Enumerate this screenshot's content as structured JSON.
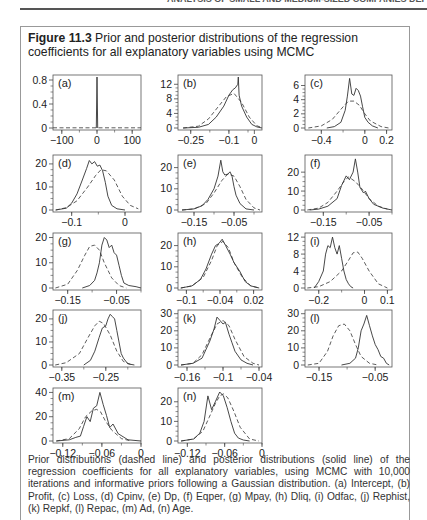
{
  "page": {
    "running_head": "ANALYSIS OF SMALL AND MEDIUM-SIZED COMPANIES DEF"
  },
  "figure": {
    "label": "Figure 11.3",
    "title": "Prior and posterior distributions of the regression coefficients for all explanatory variables using MCMC",
    "caption": "Prior distributions (dashed line) and posterior distributions (solid line) of the regression coefficients for all explanatory variables, using MCMC with 10,000 iterations and informative priors following a Gaussian distribution. (a) Intercept, (b) Profit, (c) Loss, (d) Cpinv, (e) Dp, (f) Eqper, (g) Mpay, (h) Dliq, (i) Odfac, (j) Rephist, (k) Repkf, (l) Repac, (m) Ad, (n) Age."
  },
  "colors": {
    "line": "#333333",
    "axis": "#444444",
    "frame": "#555555"
  },
  "chart_data": [
    {
      "panel": "(a)",
      "variable": "Intercept",
      "type": "line",
      "xlim": [
        -125,
        125
      ],
      "ylim": [
        0,
        0.85
      ],
      "xticks": [
        -100,
        0,
        100
      ],
      "yticks": [
        0,
        0.4,
        0.8
      ],
      "ytick_labels": [
        "0",
        "0.4",
        "0.8"
      ],
      "prior": {
        "x": [
          -125,
          125
        ],
        "y": [
          0.004,
          0.004
        ]
      },
      "posterior": {
        "x": [
          -2,
          0,
          0.001,
          2
        ],
        "y": [
          0,
          0.85,
          0.85,
          0
        ]
      }
    },
    {
      "panel": "(b)",
      "variable": "Profit",
      "type": "line",
      "xlim": [
        -0.3,
        0.03
      ],
      "ylim": [
        0,
        14
      ],
      "xticks": [
        -0.25,
        -0.1,
        0
      ],
      "ytick_labels": [
        "0",
        "4",
        "8",
        "12"
      ],
      "yticks": [
        0,
        4,
        8,
        12
      ],
      "prior": {
        "x": [
          -0.28,
          -0.22,
          -0.18,
          -0.14,
          -0.11,
          -0.08,
          -0.05,
          -0.02,
          0.01,
          0.03
        ],
        "y": [
          0,
          0.5,
          2.5,
          6,
          8.6,
          9.5,
          7,
          3,
          0.6,
          0.1
        ]
      },
      "posterior": {
        "x": [
          -0.28,
          -0.22,
          -0.18,
          -0.15,
          -0.12,
          -0.1,
          -0.085,
          -0.075,
          -0.065,
          -0.063,
          -0.06,
          -0.05,
          -0.03,
          -0.01,
          0.01,
          0.03
        ],
        "y": [
          0,
          0.2,
          1,
          3,
          6,
          9,
          10.5,
          11,
          12,
          14,
          9,
          6,
          3,
          1,
          0.3,
          0
        ]
      }
    },
    {
      "panel": "(c)",
      "variable": "Loss",
      "type": "line",
      "xlim": [
        -0.55,
        0.25
      ],
      "ylim": [
        0,
        7.2
      ],
      "xticks": [
        -0.4,
        0,
        0.2
      ],
      "yticks": [
        0,
        2,
        4,
        6
      ],
      "ytick_labels": [
        "0",
        "2",
        "4",
        "6"
      ],
      "prior": {
        "x": [
          -0.52,
          -0.4,
          -0.3,
          -0.2,
          -0.15,
          -0.1,
          -0.05,
          0,
          0.05,
          0.15,
          0.22
        ],
        "y": [
          0,
          0.3,
          1.2,
          3,
          3.8,
          3.8,
          3.2,
          2,
          1,
          0.2,
          0
        ]
      },
      "posterior": {
        "x": [
          -0.35,
          -0.28,
          -0.22,
          -0.18,
          -0.16,
          -0.14,
          -0.12,
          -0.1,
          -0.08,
          -0.06,
          -0.04,
          -0.02,
          0,
          0.03,
          0.07,
          0.12
        ],
        "y": [
          0,
          0.2,
          0.8,
          2.5,
          4.5,
          7,
          4.8,
          4.6,
          5.6,
          5.3,
          4.5,
          3,
          1.5,
          0.8,
          0.3,
          0
        ]
      }
    },
    {
      "panel": "(d)",
      "variable": "Cpinv",
      "type": "line",
      "xlim": [
        -0.135,
        0.03
      ],
      "ylim": [
        0,
        23
      ],
      "xticks": [
        -0.1,
        0
      ],
      "yticks": [
        0,
        10,
        20
      ],
      "ytick_labels": [
        "0",
        "10",
        "20"
      ],
      "prior": {
        "x": [
          -0.13,
          -0.11,
          -0.09,
          -0.07,
          -0.055,
          -0.045,
          -0.035,
          -0.02,
          -0.005,
          0.01,
          0.025
        ],
        "y": [
          0,
          1,
          4,
          10,
          15,
          17.5,
          17,
          13,
          6,
          2,
          0.5
        ]
      },
      "posterior": {
        "x": [
          -0.13,
          -0.11,
          -0.1,
          -0.09,
          -0.08,
          -0.072,
          -0.067,
          -0.062,
          -0.057,
          -0.052,
          -0.047,
          -0.042,
          -0.037,
          -0.032,
          -0.025,
          -0.015,
          0
        ],
        "y": [
          0,
          0.8,
          3,
          7,
          13,
          18,
          21.5,
          20,
          21,
          19,
          19.5,
          17,
          12,
          6,
          2,
          0.5,
          0
        ]
      }
    },
    {
      "panel": "(e)",
      "variable": "Dp",
      "type": "line",
      "xlim": [
        -0.19,
        0.02
      ],
      "ylim": [
        0,
        25
      ],
      "xticks": [
        -0.15,
        -0.05
      ],
      "yticks": [
        0,
        10,
        20
      ],
      "ytick_labels": [
        "0",
        "10",
        "20"
      ],
      "prior": {
        "x": [
          -0.18,
          -0.15,
          -0.12,
          -0.1,
          -0.08,
          -0.065,
          -0.05,
          -0.035,
          -0.02,
          0,
          0.015
        ],
        "y": [
          0,
          0.5,
          3,
          8,
          14,
          17,
          16,
          11,
          5,
          1,
          0
        ]
      },
      "posterior": {
        "x": [
          -0.18,
          -0.15,
          -0.13,
          -0.115,
          -0.1,
          -0.09,
          -0.083,
          -0.078,
          -0.073,
          -0.065,
          -0.06,
          -0.055,
          -0.05,
          -0.045,
          -0.035,
          -0.02,
          0
        ],
        "y": [
          0,
          0.5,
          2,
          5,
          10,
          16,
          23.5,
          18,
          16.5,
          17,
          18,
          16,
          11,
          7,
          3,
          0.5,
          0
        ]
      }
    },
    {
      "panel": "(f)",
      "variable": "Eqper",
      "type": "line",
      "xlim": [
        -0.19,
        0.0
      ],
      "ylim": [
        0,
        28
      ],
      "xticks": [
        -0.15,
        -0.05
      ],
      "yticks": [
        0,
        10,
        20
      ],
      "ytick_labels": [
        "0",
        "10",
        "20"
      ],
      "prior": {
        "x": [
          -0.185,
          -0.16,
          -0.14,
          -0.12,
          -0.105,
          -0.095,
          -0.08,
          -0.065,
          -0.05,
          -0.03,
          -0.01
        ],
        "y": [
          0,
          1,
          4,
          10,
          15,
          17.5,
          15,
          11,
          6,
          2,
          0.5
        ]
      },
      "posterior": {
        "x": [
          -0.18,
          -0.16,
          -0.14,
          -0.12,
          -0.11,
          -0.1,
          -0.093,
          -0.085,
          -0.08,
          -0.075,
          -0.07,
          -0.062,
          -0.058,
          -0.05,
          -0.04,
          -0.02,
          0
        ],
        "y": [
          0,
          0.5,
          2,
          6,
          13,
          18,
          16,
          20,
          27,
          20,
          12,
          9,
          10,
          6,
          3,
          1,
          0
        ]
      }
    },
    {
      "panel": "(g)",
      "variable": "Mpay",
      "type": "line",
      "xlim": [
        -0.18,
        0.0
      ],
      "ylim": [
        0,
        21
      ],
      "xticks": [
        -0.15,
        -0.05
      ],
      "yticks": [
        0,
        10,
        20
      ],
      "ytick_labels": [
        "0",
        "10",
        "20"
      ],
      "prior": {
        "x": [
          -0.175,
          -0.15,
          -0.13,
          -0.115,
          -0.105,
          -0.095,
          -0.085,
          -0.075,
          -0.06,
          -0.045,
          -0.03
        ],
        "y": [
          0,
          1.5,
          7,
          13,
          16.5,
          17,
          15,
          10,
          4,
          1,
          0
        ]
      },
      "posterior": {
        "x": [
          -0.12,
          -0.105,
          -0.095,
          -0.09,
          -0.085,
          -0.08,
          -0.075,
          -0.07,
          -0.065,
          -0.06,
          -0.055,
          -0.05,
          -0.045,
          -0.04,
          -0.035,
          -0.025,
          -0.01,
          0
        ],
        "y": [
          0,
          1,
          3,
          6,
          10,
          17,
          20,
          19,
          16,
          17,
          14,
          13,
          9,
          5,
          2,
          1,
          0.5,
          0
        ]
      }
    },
    {
      "panel": "(h)",
      "variable": "Dliq",
      "type": "line",
      "xlim": [
        -0.115,
        0.035
      ],
      "ylim": [
        0,
        25
      ],
      "xticks": [
        -0.1,
        -0.04,
        0.02
      ],
      "yticks": [
        0,
        10,
        20
      ],
      "ytick_labels": [
        "0",
        "10",
        "20"
      ],
      "prior": {
        "x": [
          -0.11,
          -0.09,
          -0.07,
          -0.055,
          -0.045,
          -0.035,
          -0.025,
          -0.015,
          0,
          0.015,
          0.03
        ],
        "y": [
          0,
          1,
          5,
          13,
          20,
          22,
          19,
          12,
          5,
          1,
          0
        ]
      },
      "posterior": {
        "x": [
          -0.11,
          -0.09,
          -0.075,
          -0.065,
          -0.055,
          -0.048,
          -0.042,
          -0.036,
          -0.03,
          -0.022,
          -0.015,
          -0.005,
          0.005,
          0.015,
          0.03
        ],
        "y": [
          0,
          1,
          4,
          9,
          16,
          20,
          21,
          23,
          20,
          16,
          12,
          8,
          3,
          1,
          0
        ]
      }
    },
    {
      "panel": "(i)",
      "variable": "Odfac",
      "type": "line",
      "xlim": [
        -0.26,
        0.12
      ],
      "ylim": [
        0,
        12.5
      ],
      "xticks": [
        -0.2,
        0,
        0.1
      ],
      "yticks": [
        0,
        4,
        8,
        12
      ],
      "ytick_labels": [
        "0",
        "4",
        "8",
        "12"
      ],
      "prior": {
        "x": [
          -0.25,
          -0.2,
          -0.15,
          -0.1,
          -0.07,
          -0.05,
          -0.03,
          -0.01,
          0.02,
          0.06,
          0.1
        ],
        "y": [
          0,
          0.3,
          1.5,
          4,
          6.5,
          8.3,
          8.5,
          7,
          4,
          1,
          0
        ]
      },
      "posterior": {
        "x": [
          -0.22,
          -0.2,
          -0.18,
          -0.17,
          -0.16,
          -0.15,
          -0.14,
          -0.13,
          -0.12,
          -0.11,
          -0.1,
          -0.09,
          -0.08,
          -0.07,
          -0.06,
          -0.05
        ],
        "y": [
          0,
          1.5,
          4,
          8,
          10,
          9.5,
          12,
          9.5,
          8,
          10,
          7,
          4,
          2,
          1,
          0.3,
          0
        ]
      }
    },
    {
      "panel": "(j)",
      "variable": "Rephist",
      "type": "line",
      "xlim": [
        -0.37,
        -0.17
      ],
      "ylim": [
        0,
        23
      ],
      "xticks": [
        -0.35,
        -0.25
      ],
      "yticks": [
        0,
        10,
        20
      ],
      "ytick_labels": [
        "0",
        "10",
        "20"
      ],
      "prior": {
        "x": [
          -0.365,
          -0.34,
          -0.31,
          -0.29,
          -0.275,
          -0.265,
          -0.255,
          -0.24,
          -0.225,
          -0.21,
          -0.19
        ],
        "y": [
          0,
          1,
          5,
          12,
          17,
          19,
          18,
          13,
          6,
          1.5,
          0
        ]
      },
      "posterior": {
        "x": [
          -0.3,
          -0.285,
          -0.275,
          -0.265,
          -0.258,
          -0.25,
          -0.245,
          -0.24,
          -0.235,
          -0.23,
          -0.225,
          -0.22,
          -0.215,
          -0.21,
          -0.2,
          -0.185
        ],
        "y": [
          0,
          2,
          6,
          12,
          16,
          17,
          20,
          22,
          21,
          20,
          15,
          10,
          5,
          3,
          0.5,
          0
        ]
      }
    },
    {
      "panel": "(k)",
      "variable": "Repkf",
      "type": "line",
      "xlim": [
        -0.175,
        -0.035
      ],
      "ylim": [
        0,
        31
      ],
      "xticks": [
        -0.16,
        -0.1,
        -0.04
      ],
      "yticks": [
        0,
        10,
        20,
        30
      ],
      "ytick_labels": [
        "0",
        "10",
        "20",
        "30"
      ],
      "prior": {
        "x": [
          -0.17,
          -0.15,
          -0.135,
          -0.12,
          -0.11,
          -0.1,
          -0.09,
          -0.08,
          -0.065,
          -0.05,
          -0.04
        ],
        "y": [
          0,
          1,
          6,
          17,
          24,
          26,
          23,
          15,
          5,
          1,
          0
        ]
      },
      "posterior": {
        "x": [
          -0.17,
          -0.15,
          -0.135,
          -0.122,
          -0.115,
          -0.11,
          -0.105,
          -0.1,
          -0.096,
          -0.09,
          -0.085,
          -0.08,
          -0.07,
          -0.06,
          -0.05
        ],
        "y": [
          0,
          1,
          4,
          14,
          21,
          28,
          26,
          24,
          25,
          18,
          13,
          8,
          3,
          1,
          0
        ]
      }
    },
    {
      "panel": "(l)",
      "variable": "Repac",
      "type": "line",
      "xlim": [
        -0.175,
        -0.02
      ],
      "ylim": [
        0,
        31
      ],
      "xticks": [
        -0.15,
        -0.05
      ],
      "yticks": [
        0,
        10,
        20,
        30
      ],
      "ytick_labels": [
        "0",
        "10",
        "20",
        "30"
      ],
      "prior": {
        "x": [
          -0.17,
          -0.15,
          -0.135,
          -0.125,
          -0.115,
          -0.105,
          -0.095,
          -0.085,
          -0.075,
          -0.06,
          -0.045
        ],
        "y": [
          0,
          1,
          8,
          17,
          23,
          24,
          20,
          12,
          5,
          1,
          0
        ]
      },
      "posterior": {
        "x": [
          -0.11,
          -0.095,
          -0.085,
          -0.08,
          -0.075,
          -0.07,
          -0.065,
          -0.06,
          -0.055,
          -0.05,
          -0.045,
          -0.04,
          -0.035,
          -0.03,
          -0.025
        ],
        "y": [
          0,
          1,
          4,
          10,
          20,
          24,
          29,
          23,
          17,
          12,
          9,
          5,
          4,
          1,
          0
        ]
      }
    },
    {
      "panel": "(m)",
      "variable": "Ad",
      "type": "line",
      "xlim": [
        -0.135,
        0.0
      ],
      "ylim": [
        0,
        42
      ],
      "xticks": [
        -0.12,
        -0.06,
        0
      ],
      "yticks": [
        0,
        20,
        40
      ],
      "ytick_labels": [
        "0",
        "20",
        "40"
      ],
      "prior": {
        "x": [
          -0.13,
          -0.11,
          -0.095,
          -0.085,
          -0.075,
          -0.068,
          -0.062,
          -0.055,
          -0.045,
          -0.03,
          -0.015
        ],
        "y": [
          0,
          2,
          10,
          20,
          25,
          26,
          24,
          17,
          9,
          2,
          0
        ]
      },
      "posterior": {
        "x": [
          -0.13,
          -0.11,
          -0.1,
          -0.093,
          -0.088,
          -0.083,
          -0.078,
          -0.073,
          -0.068,
          -0.063,
          -0.058,
          -0.053,
          -0.048,
          -0.043,
          -0.035,
          -0.02,
          0
        ],
        "y": [
          0,
          1,
          3,
          4,
          12,
          20,
          16,
          27,
          29,
          40,
          30,
          21,
          11,
          14,
          6,
          1,
          0
        ]
      }
    },
    {
      "panel": "(n)",
      "variable": "Age",
      "type": "line",
      "xlim": [
        -0.135,
        0.0
      ],
      "ylim": [
        0,
        26
      ],
      "xticks": [
        -0.12,
        -0.06,
        0
      ],
      "yticks": [
        0,
        10,
        20
      ],
      "ytick_labels": [
        "0",
        "10",
        "20"
      ],
      "prior": {
        "x": [
          -0.13,
          -0.11,
          -0.095,
          -0.085,
          -0.075,
          -0.068,
          -0.062,
          -0.055,
          -0.045,
          -0.035,
          -0.02,
          -0.005
        ],
        "y": [
          0,
          1,
          5,
          12,
          19,
          23,
          24,
          22,
          15,
          7,
          1,
          0
        ]
      },
      "posterior": {
        "x": [
          -0.13,
          -0.11,
          -0.1,
          -0.093,
          -0.087,
          -0.081,
          -0.075,
          -0.068,
          -0.062,
          -0.056,
          -0.05,
          -0.044,
          -0.038,
          -0.03,
          -0.02
        ],
        "y": [
          0,
          1,
          4,
          10,
          23,
          16,
          20,
          25,
          23,
          17,
          10,
          4,
          1.5,
          0.5,
          0
        ]
      }
    }
  ]
}
